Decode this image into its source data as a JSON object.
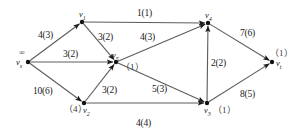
{
  "diagram": {
    "node_label_prefix": "v",
    "nodes": [
      {
        "id": "vs",
        "label": "v",
        "sub": "s",
        "x": 28,
        "y": 62,
        "annotation": "∞",
        "annotation_pos": "above"
      },
      {
        "id": "v1",
        "label": "v",
        "sub": "1",
        "x": 82,
        "y": 22,
        "annotation": "",
        "annotation_pos": "above"
      },
      {
        "id": "v2",
        "label": "v",
        "sub": "2",
        "x": 84,
        "y": 103,
        "annotation": "（4）",
        "annotation_pos": "left"
      },
      {
        "id": "v5",
        "label": "v",
        "sub": "5",
        "x": 116,
        "y": 62,
        "annotation": "（1）",
        "annotation_pos": "right"
      },
      {
        "id": "v4",
        "label": "v",
        "sub": "4",
        "x": 208,
        "y": 23,
        "annotation": "",
        "annotation_pos": "above"
      },
      {
        "id": "v3",
        "label": "v",
        "sub": "3",
        "x": 207,
        "y": 103,
        "annotation": "（1）",
        "annotation_pos": "right"
      },
      {
        "id": "vt",
        "label": "v",
        "sub": "t",
        "x": 272,
        "y": 62,
        "annotation": "（1）",
        "annotation_pos": "above"
      }
    ],
    "edges": [
      {
        "id": "vs-v1",
        "from": "vs",
        "to": "v1",
        "capacity": 4,
        "flow": 3,
        "label": "4(3)",
        "lx": 38,
        "ly": 31
      },
      {
        "id": "vs-v5",
        "from": "vs",
        "to": "v5",
        "capacity": 3,
        "flow": 2,
        "label": "3(2)",
        "lx": 63,
        "ly": 50
      },
      {
        "id": "vs-v2",
        "from": "vs",
        "to": "v2",
        "capacity": 10,
        "flow": 6,
        "label": "10(6)",
        "lx": 33,
        "ly": 87
      },
      {
        "id": "v1-v4",
        "from": "v1",
        "to": "v4",
        "capacity": 1,
        "flow": 1,
        "label": "1(1)",
        "lx": 137,
        "ly": 9
      },
      {
        "id": "v1-v5",
        "from": "v1",
        "to": "v5",
        "capacity": 3,
        "flow": 2,
        "label": "3(2)",
        "lx": 98,
        "ly": 33
      },
      {
        "id": "v5-v4",
        "from": "v5",
        "to": "v4",
        "capacity": 4,
        "flow": 3,
        "label": "4(3)",
        "lx": 140,
        "ly": 33
      },
      {
        "id": "v5-v3",
        "from": "v5",
        "to": "v3",
        "capacity": 5,
        "flow": 3,
        "label": "5(3)",
        "lx": 152,
        "ly": 85
      },
      {
        "id": "v2-v5",
        "from": "v2",
        "to": "v5",
        "capacity": 3,
        "flow": 2,
        "label": "3(2)",
        "lx": 102,
        "ly": 86
      },
      {
        "id": "v2-v3",
        "from": "v2",
        "to": "v3",
        "capacity": 4,
        "flow": 4,
        "label": "4(4)",
        "lx": 136,
        "ly": 119
      },
      {
        "id": "v3-v4",
        "from": "v3",
        "to": "v4",
        "capacity": 2,
        "flow": 2,
        "label": "2(2)",
        "lx": 211,
        "ly": 59
      },
      {
        "id": "v4-vt",
        "from": "v4",
        "to": "vt",
        "capacity": 7,
        "flow": 6,
        "label": "7(6)",
        "lx": 240,
        "ly": 29
      },
      {
        "id": "v3-vt",
        "from": "v3",
        "to": "vt",
        "capacity": 8,
        "flow": 5,
        "label": "8(5)",
        "lx": 240,
        "ly": 90
      }
    ]
  }
}
